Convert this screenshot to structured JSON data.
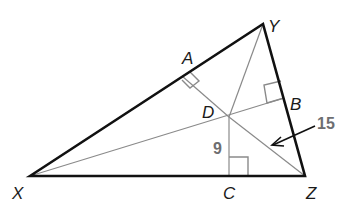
{
  "diagram": {
    "type": "triangle-incenter",
    "colors": {
      "triangle": "#111111",
      "interior_lines": "#8a8a8a",
      "measure_text": "#6d6e71",
      "label_text": "#1a1a1a"
    },
    "vertices": {
      "X": {
        "label": "X",
        "x": 30,
        "y": 176
      },
      "Y": {
        "label": "Y",
        "x": 263,
        "y": 24
      },
      "Z": {
        "label": "Z",
        "x": 305,
        "y": 176
      }
    },
    "points": {
      "D": {
        "label": "D",
        "x": 229,
        "y": 117
      },
      "A": {
        "label": "A",
        "x": 182,
        "y": 76
      },
      "B": {
        "label": "B",
        "x": 284,
        "y": 98
      },
      "C": {
        "label": "C",
        "x": 229,
        "y": 176
      }
    },
    "measures": {
      "DC": "9",
      "DZ": "15"
    },
    "right_angle_marks": [
      "A",
      "B",
      "C"
    ]
  }
}
